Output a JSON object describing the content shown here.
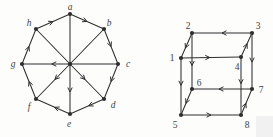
{
  "figure": {
    "background": "#fdfdfc",
    "ink": "#2f2f2f",
    "label_color": "#3f3f3f",
    "graphs": [
      {
        "id": "octagon-digraph",
        "label_style": "italic",
        "vertices": [
          {
            "id": "a",
            "label": "a",
            "x": 70,
            "y": 14,
            "lx": 70,
            "ly": 10
          },
          {
            "id": "b",
            "label": "b",
            "x": 104,
            "y": 29,
            "lx": 109,
            "ly": 26
          },
          {
            "id": "c",
            "label": "c",
            "x": 118,
            "y": 64,
            "lx": 128,
            "ly": 67
          },
          {
            "id": "d",
            "label": "d",
            "x": 104,
            "y": 99,
            "lx": 113,
            "ly": 108
          },
          {
            "id": "e",
            "label": "e",
            "x": 70,
            "y": 114,
            "lx": 69,
            "ly": 127
          },
          {
            "id": "f",
            "label": "f",
            "x": 36,
            "y": 99,
            "lx": 29,
            "ly": 110
          },
          {
            "id": "g",
            "label": "g",
            "x": 22,
            "y": 64,
            "lx": 13,
            "ly": 67
          },
          {
            "id": "h",
            "label": "h",
            "x": 36,
            "y": 29,
            "lx": 29,
            "ly": 26
          }
        ],
        "crossing_dot": {
          "x": 70,
          "y": 64
        },
        "edges": [
          {
            "from": "a",
            "to": "b",
            "arrow_at": 0.5
          },
          {
            "from": "b",
            "to": "c",
            "arrow_at": 0.5
          },
          {
            "from": "c",
            "to": "d",
            "arrow_at": 0.5
          },
          {
            "from": "d",
            "to": "e",
            "arrow_at": 0.45
          },
          {
            "from": "e",
            "to": "f",
            "arrow_at": 0.45
          },
          {
            "from": "f",
            "to": "g",
            "arrow_at": 0.5
          },
          {
            "from": "g",
            "to": "h",
            "arrow_at": 0.5
          },
          {
            "from": "h",
            "to": "a",
            "arrow_at": 0.5
          },
          {
            "from": "a",
            "to": "e",
            "arrow_at": 0.78
          },
          {
            "from": "b",
            "to": "f",
            "arrow_at": 0.72
          },
          {
            "from": "c",
            "to": "g",
            "arrow_at": 0.69
          },
          {
            "from": "h",
            "to": "d",
            "arrow_at": 0.72
          }
        ]
      },
      {
        "id": "cube-digraph",
        "label_style": "normal",
        "vertices": [
          {
            "id": "1",
            "label": "1",
            "x": 181,
            "y": 58,
            "lx": 172,
            "ly": 61
          },
          {
            "id": "2",
            "label": "2",
            "x": 192,
            "y": 33,
            "lx": 188,
            "ly": 29
          },
          {
            "id": "3",
            "label": "3",
            "x": 252,
            "y": 33,
            "lx": 258,
            "ly": 29
          },
          {
            "id": "4",
            "label": "4",
            "x": 241,
            "y": 57,
            "lx": 237,
            "ly": 70
          },
          {
            "id": "5",
            "label": "5",
            "x": 181,
            "y": 115,
            "lx": 175,
            "ly": 128
          },
          {
            "id": "6",
            "label": "6",
            "x": 192,
            "y": 89,
            "lx": 199,
            "ly": 86
          },
          {
            "id": "7",
            "label": "7",
            "x": 252,
            "y": 89,
            "lx": 261,
            "ly": 93
          },
          {
            "id": "8",
            "label": "8",
            "x": 241,
            "y": 115,
            "lx": 247,
            "ly": 128
          }
        ],
        "edges": [
          {
            "from": "3",
            "to": "2",
            "arrow_at": 0.5
          },
          {
            "from": "2",
            "to": "1",
            "arrow_at": 0.6
          },
          {
            "from": "1",
            "to": "4",
            "arrow_at": 0.48
          },
          {
            "from": "4",
            "to": "3",
            "arrow_at": 0.55
          },
          {
            "from": "2",
            "to": "6",
            "arrow_at": 0.58
          },
          {
            "from": "1",
            "to": "5",
            "arrow_at": 0.48
          },
          {
            "from": "3",
            "to": "7",
            "arrow_at": 0.52
          },
          {
            "from": "4",
            "to": "8",
            "arrow_at": 0.46
          },
          {
            "from": "7",
            "to": "6",
            "arrow_at": 0.55
          },
          {
            "from": "6",
            "to": "5",
            "arrow_at": 0.55
          },
          {
            "from": "5",
            "to": "8",
            "arrow_at": 0.5
          },
          {
            "from": "8",
            "to": "7",
            "arrow_at": 0.45
          }
        ]
      }
    ],
    "artifacts": [
      {
        "id": "corner-smudge",
        "x": 256,
        "y": 116,
        "w": 17,
        "h": 21,
        "color": "#f1f1f1"
      }
    ]
  }
}
